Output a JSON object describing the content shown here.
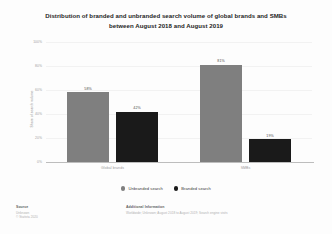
{
  "chart_data": {
    "type": "bar",
    "title": "Distribution of branded and unbranded search volume of global brands and SMBs between August 2018 and August 2019",
    "title_lines": [
      "Distribution of branded and unbranded search volume of global brands and SMBs",
      "between August 2018 and August 2019"
    ],
    "categories": [
      "Global brands",
      "SMBs"
    ],
    "series": [
      {
        "name": "Unbranded search",
        "values": [
          58,
          42
        ],
        "color": "#7f7f7f"
      },
      {
        "name": "Branded search",
        "values": [
          42,
          19
        ],
        "color": "#1a1a1a"
      }
    ],
    "bars": [
      {
        "group": "Global brands",
        "series": "Unbranded search",
        "value": 58,
        "label": "58%"
      },
      {
        "group": "Global brands",
        "series": "Branded search",
        "value": 42,
        "label": "42%"
      },
      {
        "group": "SMBs",
        "series": "Unbranded search",
        "value": 81,
        "label": "81%"
      },
      {
        "group": "SMBs",
        "series": "Branded search",
        "value": 19,
        "label": "19%"
      }
    ],
    "xlabel": "",
    "ylabel": "Share of search volume",
    "ylim": [
      0,
      100
    ],
    "yticks": [
      "100%",
      "80%",
      "60%",
      "40%",
      "20%",
      "0%"
    ],
    "ytick_values": [
      100,
      80,
      60,
      40,
      20,
      0
    ],
    "grid": true,
    "legend_position": "bottom"
  },
  "legend": {
    "items": [
      {
        "label": "Unbranded search",
        "color": "#7f7f7f"
      },
      {
        "label": "Branded search",
        "color": "#1a1a1a"
      }
    ]
  },
  "footer": {
    "source_heading": "Source",
    "source_lines": [
      "Unknown",
      "© Statista 2020"
    ],
    "info_heading": "Additional Information",
    "info_lines": [
      "Worldwide; Unknown; August 2018 to August 2019; Search engine visits"
    ]
  }
}
